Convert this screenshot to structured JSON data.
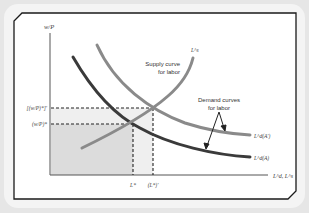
{
  "diagram": {
    "y_axis_label": "w/P",
    "x_axis_label": "L^d, L^s",
    "y_ticks": [
      {
        "label": "[(w/P)*]'",
        "y": 108
      },
      {
        "label": "(w/P)*",
        "y": 124
      }
    ],
    "x_ticks": [
      {
        "label": "L*",
        "x": 133
      },
      {
        "label": "(L*)'",
        "x": 153
      }
    ],
    "curves": {
      "supply": {
        "label": "L^s",
        "annotation_line1": "Supply curve",
        "annotation_line2": "for labor"
      },
      "demand_A_prime": {
        "label": "L^d(A')"
      },
      "demand_A": {
        "label": "L^d(A)"
      },
      "demand_annotation_line1": "Demand curves",
      "demand_annotation_line2": "for labor"
    },
    "colors": {
      "frame_background": "#e6e6e6",
      "panel_background": "#ffffff",
      "border": "#1a1a1a",
      "supply_curve": "#8a8a8a",
      "demand_A_prime_curve": "#8a8a8a",
      "demand_A_curve": "#3a3a3a",
      "shade_dark": "#d9d9d9",
      "shade_light": "#ececec"
    }
  }
}
